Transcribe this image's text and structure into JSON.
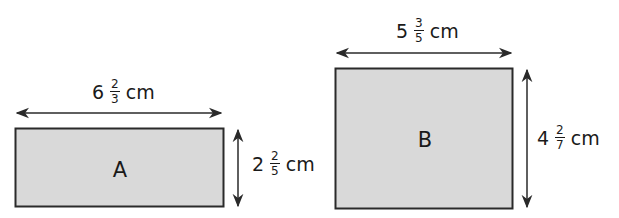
{
  "colors": {
    "fill": "#d9d9d9",
    "stroke": "#2a2a2a",
    "text": "#1a1a1a"
  },
  "rectangles": [
    {
      "name": "A",
      "width_label": {
        "whole": "6",
        "numerator": "2",
        "denominator": "3",
        "unit": "cm"
      },
      "height_label": {
        "whole": "2",
        "numerator": "2",
        "denominator": "5",
        "unit": "cm"
      }
    },
    {
      "name": "B",
      "width_label": {
        "whole": "5",
        "numerator": "3",
        "denominator": "5",
        "unit": "cm"
      },
      "height_label": {
        "whole": "4",
        "numerator": "2",
        "denominator": "7",
        "unit": "cm"
      }
    }
  ]
}
